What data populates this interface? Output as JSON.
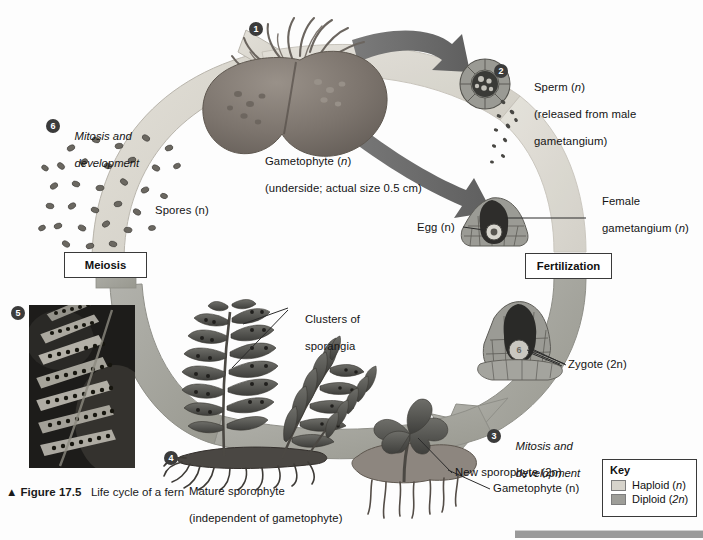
{
  "figure": {
    "triangle": "▲",
    "number": "Figure 17.5",
    "title": "Life cycle of a fern"
  },
  "steps": {
    "one": "1",
    "two": "2",
    "three": "3",
    "four": "4",
    "five": "5",
    "six": "6",
    "zygote_badge": "6"
  },
  "step_labels": {
    "six_line1": "Mitosis and",
    "six_line2": "development",
    "three_line1": "Mitosis and",
    "three_line2": "development"
  },
  "labels": {
    "gametophyte_line1": "Gametophyte (n)",
    "gametophyte_line2": "(underside; actual size 0.5 cm)",
    "sperm_line1": "Sperm (n)",
    "sperm_line2": "(released from male",
    "sperm_line3": "gametangium)",
    "female_gametangium_line1": "Female",
    "female_gametangium_line2": "gametangium (n)",
    "egg": "Egg (n)",
    "zygote": "Zygote (2n)",
    "new_sporophyte": "New sporophyte (2n)",
    "gametophyte_small": "Gametophyte (n)",
    "mature_sporophyte_line1": "Mature sporophyte",
    "mature_sporophyte_line2": "(independent of gametophyte)",
    "clusters_line1": "Clusters of",
    "clusters_line2": "sporangia",
    "spores": "Spores (n)"
  },
  "process_boxes": {
    "meiosis": "Meiosis",
    "fertilization": "Fertilization"
  },
  "key": {
    "title": "Key",
    "haploid_label": "Haploid (n)",
    "haploid_color": "#d6d3cb",
    "diploid_label": "Diploid (2n)",
    "diploid_color": "#9e9e99"
  },
  "colors": {
    "haploid_arc": "#d9d6ce",
    "diploid_arc": "#a6a6a0",
    "dark_arrow": "#6f6f6f",
    "tissue": "#8a8a84",
    "dark_tissue": "#3a3a38",
    "outline": "#4a4a4a",
    "background": "#fdfdfd",
    "bottom_bar": "#9a9a9a"
  }
}
